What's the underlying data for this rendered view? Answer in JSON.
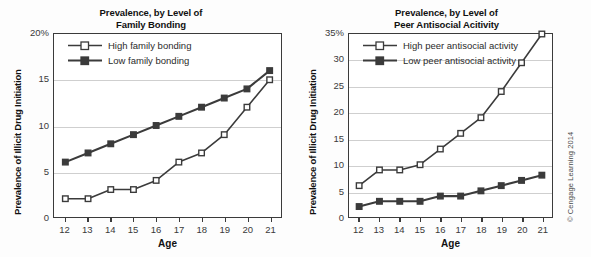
{
  "figure": {
    "credit": "© Cengage Learning 2014"
  },
  "chart_data": [
    {
      "id": "family-bonding",
      "type": "line",
      "title": "Prevalence, by Level of Family Bonding",
      "title_line1": "Prevalence, by Level of",
      "title_line2": "Family Bonding",
      "xlabel": "Age",
      "ylabel": "Prevalence of Illicit Drug Initiation",
      "x": [
        12,
        13,
        14,
        15,
        16,
        17,
        18,
        19,
        20,
        21
      ],
      "categories": [
        "12",
        "13",
        "14",
        "15",
        "16",
        "17",
        "18",
        "19",
        "20",
        "21"
      ],
      "xlim": [
        11.5,
        21.5
      ],
      "ylim": [
        0,
        20
      ],
      "yticks": [
        0,
        5,
        10,
        15,
        20
      ],
      "ytick_labels": [
        "0",
        "5",
        "10",
        "15",
        "20%"
      ],
      "grid": "horizontal",
      "legend_position": "top-left",
      "series": [
        {
          "name": "High family bonding",
          "marker": "open-square",
          "color": "#3b3b3b",
          "values": [
            2,
            2,
            3,
            3,
            4,
            6,
            7,
            9,
            12,
            15
          ]
        },
        {
          "name": "Low family bonding",
          "marker": "filled-square",
          "color": "#3b3b3b",
          "values": [
            6,
            7,
            8,
            9,
            10,
            11,
            12,
            13,
            14,
            16
          ]
        }
      ]
    },
    {
      "id": "peer-antisocial-activity",
      "type": "line",
      "title": "Prevalence, by Level of Peer Antisocial Acitivity",
      "title_line1": "Prevalence, by Level of",
      "title_line2": "Peer Antisocial Acitivity",
      "xlabel": "Age",
      "ylabel": "Prevalence of Illicit Drug Initiation",
      "x": [
        12,
        13,
        14,
        15,
        16,
        17,
        18,
        19,
        20,
        21
      ],
      "categories": [
        "12",
        "13",
        "14",
        "15",
        "16",
        "17",
        "18",
        "19",
        "20",
        "21"
      ],
      "xlim": [
        11.5,
        21.5
      ],
      "ylim": [
        0,
        35
      ],
      "yticks": [
        0,
        5,
        10,
        15,
        20,
        25,
        30,
        35
      ],
      "ytick_labels": [
        "0",
        "5",
        "10",
        "15",
        "20",
        "25",
        "30",
        "35%"
      ],
      "grid": "horizontal",
      "legend_position": "top-left",
      "series": [
        {
          "name": "High peer antisocial activity",
          "marker": "open-square",
          "color": "#3b3b3b",
          "values": [
            6,
            9,
            9,
            10,
            13,
            16,
            19,
            24,
            29.5,
            35
          ]
        },
        {
          "name": "Low peer antisocial activity",
          "marker": "filled-square",
          "color": "#3b3b3b",
          "values": [
            2,
            3,
            3,
            3,
            4,
            4,
            5,
            6,
            7,
            8
          ]
        }
      ]
    }
  ]
}
